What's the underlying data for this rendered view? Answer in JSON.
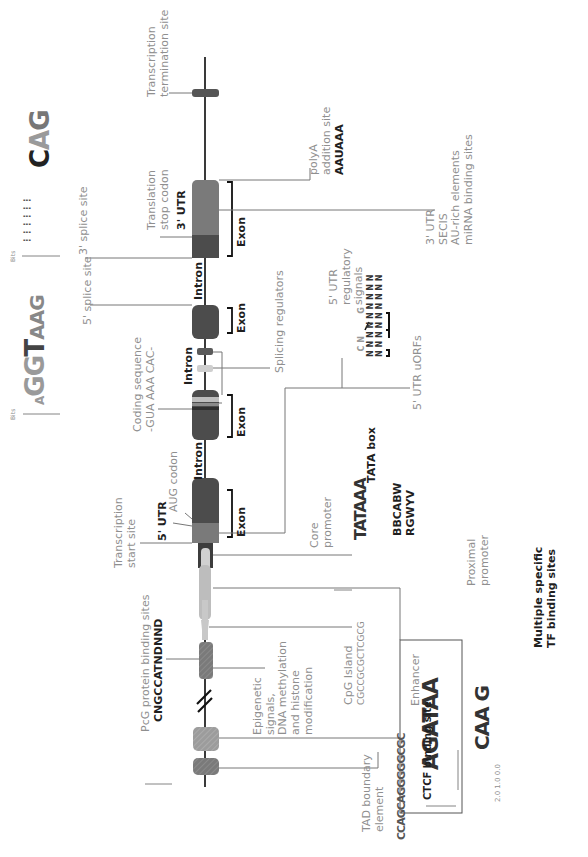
{
  "diagram": {
    "orientation": "rotated -90deg (5' at bottom, 3' at top)",
    "colors": {
      "axis": "#3a3a3a",
      "exon_dark": "#4a4a4a",
      "exon_mid": "#6e6e6e",
      "utr_light": "#8a8a8a",
      "promoter_light": "#c9c9c9",
      "label_light": "#8f8f8f",
      "label_dark": "#1f1f1f"
    },
    "labels": {
      "transcription_termination": [
        "Transcription",
        "termination site"
      ],
      "translation_stop": [
        "Translation",
        "stop codon"
      ],
      "utr3": "3' UTR",
      "exon": "Exon",
      "intron": "Intron",
      "splice3": "3' splice site",
      "splice5": "5' splice site",
      "polya": [
        "polyA",
        "addition site"
      ],
      "polya_seq": "AAUAAA",
      "utr3_elements": [
        "3' UTR",
        "SECIS",
        "AU-rich elements",
        "miRNA binding sites"
      ],
      "splicing_regulators": "Splicing regulators",
      "coding_sequence": [
        "Coding sequence",
        "-GUA  AAA  CAC-"
      ],
      "utr5_regulatory": [
        "5' UTR",
        "regulatory",
        "signals"
      ],
      "utr5_uorfs": "5' UTR uORFs",
      "aug_codon": "AUG codon",
      "utr5": "5' UTR",
      "transcription_start": [
        "Transcription",
        "start site"
      ],
      "core_promoter": [
        "Core",
        "promoter"
      ],
      "tata_box": "TATA box",
      "core_seqs": [
        "BBCABW",
        "RGWYV"
      ],
      "proximal_promoter": [
        "Proximal",
        "promoter"
      ],
      "tf_binding": [
        "Multiple specific",
        "TF binding sites"
      ],
      "pcg_sites": "PcG protein binding sites",
      "pcg_seq": "CNGCCATNDNND",
      "epigenetic": [
        "Epigenetic",
        "signals,",
        "DNA methylation",
        "and histone",
        "modification"
      ],
      "cpg_island": "CpG Island",
      "cpg_seq": "CGCCGCGCTCGCG",
      "enhancer": "Enhancer",
      "tad_boundary": [
        "TAD boundary",
        "element"
      ],
      "ctcf": "CTCF binding site"
    },
    "logos": {
      "splice3_logo": "CAG",
      "splice5_logo": "AG GT AAG",
      "tata_logo": "TATAAA",
      "enhancer_logo_1": "AGATAA",
      "enhancer_logo_2": "CAA G",
      "ctcf_logo": "CCAGCAGGGGGCGC",
      "stemloop": "N N N N N N",
      "axis_bits": "Bits",
      "ticks_3": "2 1 0",
      "ticks_enh": "2.0 1.0 0.0"
    }
  }
}
